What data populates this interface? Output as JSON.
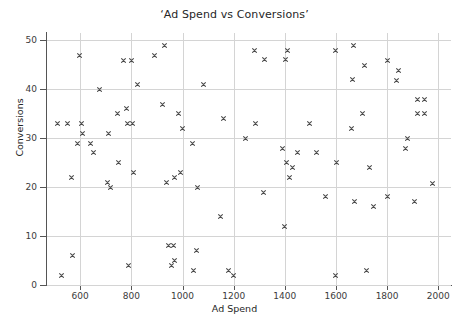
{
  "chart_data": {
    "type": "scatter",
    "title": "‘Ad Spend vs Conversions’",
    "xlabel": "Ad Spend",
    "ylabel": "Conversions",
    "xlim": [
      470,
      2050
    ],
    "ylim": [
      0,
      51.5
    ],
    "xticks": [
      600,
      800,
      1000,
      1200,
      1400,
      1600,
      1800,
      2000
    ],
    "yticks": [
      0,
      10,
      20,
      30,
      40,
      50
    ],
    "grid": true,
    "legend": null,
    "marker": "x",
    "marker_color": "#4c4c4c",
    "series": [
      {
        "name": "Ad Spend vs Conversions",
        "points": [
          [
            510,
            33.0
          ],
          [
            525,
            2.0
          ],
          [
            550,
            33.0
          ],
          [
            565,
            22.0
          ],
          [
            570,
            6.0
          ],
          [
            590,
            29.0
          ],
          [
            598,
            47.0
          ],
          [
            603,
            33.0
          ],
          [
            608,
            31.0
          ],
          [
            640,
            29.0
          ],
          [
            650,
            27.0
          ],
          [
            675,
            40.0
          ],
          [
            705,
            21.0
          ],
          [
            710,
            31.0
          ],
          [
            720,
            20.0
          ],
          [
            745,
            35.0
          ],
          [
            750,
            25.0
          ],
          [
            770,
            45.8
          ],
          [
            780,
            36.0
          ],
          [
            783,
            33.0
          ],
          [
            800,
            45.8
          ],
          [
            805,
            33.0
          ],
          [
            810,
            23.0
          ],
          [
            790,
            4.0
          ],
          [
            822,
            41.0
          ],
          [
            890,
            47.0
          ],
          [
            920,
            37.0
          ],
          [
            930,
            49.0
          ],
          [
            938,
            21.0
          ],
          [
            945,
            8.0
          ],
          [
            955,
            4.0
          ],
          [
            963,
            8.0
          ],
          [
            968,
            22.0
          ],
          [
            970,
            5.0
          ],
          [
            985,
            35.0
          ],
          [
            992,
            23.0
          ],
          [
            1000,
            32.0
          ],
          [
            1040,
            29.0
          ],
          [
            1043,
            3.0
          ],
          [
            1053,
            7.0
          ],
          [
            1060,
            20.0
          ],
          [
            1080,
            41.0
          ],
          [
            1150,
            14.0
          ],
          [
            1160,
            34.0
          ],
          [
            1178,
            3.0
          ],
          [
            1200,
            2.0
          ],
          [
            1248,
            30.0
          ],
          [
            1280,
            48.0
          ],
          [
            1285,
            33.0
          ],
          [
            1318,
            19.0
          ],
          [
            1322,
            46.0
          ],
          [
            1392,
            28.0
          ],
          [
            1398,
            12.0
          ],
          [
            1403,
            46.0
          ],
          [
            1405,
            25.0
          ],
          [
            1412,
            48.0
          ],
          [
            1418,
            22.0
          ],
          [
            1428,
            24.0
          ],
          [
            1448,
            27.0
          ],
          [
            1497,
            33.0
          ],
          [
            1522,
            27.0
          ],
          [
            1558,
            18.0
          ],
          [
            1598,
            2.0
          ],
          [
            1600,
            48.0
          ],
          [
            1602,
            25.0
          ],
          [
            1660,
            32.0
          ],
          [
            1663,
            42.0
          ],
          [
            1668,
            49.0
          ],
          [
            1673,
            17.0
          ],
          [
            1703,
            35.0
          ],
          [
            1710,
            44.8
          ],
          [
            1720,
            3.0
          ],
          [
            1730,
            24.0
          ],
          [
            1745,
            16.0
          ],
          [
            1800,
            45.8
          ],
          [
            1802,
            18.0
          ],
          [
            1838,
            41.8
          ],
          [
            1845,
            43.8
          ],
          [
            1873,
            28.0
          ],
          [
            1880,
            30.0
          ],
          [
            1908,
            17.0
          ],
          [
            1918,
            38.0
          ],
          [
            1920,
            35.0
          ],
          [
            1945,
            38.0
          ],
          [
            1948,
            35.0
          ],
          [
            1978,
            20.8
          ]
        ]
      }
    ]
  },
  "axes": {
    "title": "‘Ad Spend vs Conversions’",
    "x_label": "Ad Spend",
    "y_label": "Conversions",
    "x_tick_labels": [
      "600",
      "800",
      "1000",
      "1200",
      "1400",
      "1600",
      "1800",
      "2000"
    ],
    "y_tick_labels": [
      "0",
      "10",
      "20",
      "30",
      "40",
      "50"
    ]
  },
  "colors": {
    "marker": "#4c4c4c",
    "grid": "#d4d4d4",
    "axis": "#555555",
    "text": "#262626",
    "background": "#ffffff"
  }
}
